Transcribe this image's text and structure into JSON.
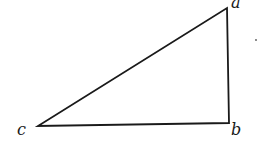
{
  "diagram": {
    "type": "right-triangle",
    "stroke_color": "#1a1a1a",
    "vertices": [
      {
        "id": "a",
        "label": "a",
        "x": 227,
        "y": 8
      },
      {
        "id": "b",
        "label": "b",
        "x": 229,
        "y": 123
      },
      {
        "id": "c",
        "label": "c",
        "x": 38,
        "y": 126
      }
    ],
    "edges": [
      [
        "a",
        "b"
      ],
      [
        "b",
        "c"
      ],
      [
        "c",
        "a"
      ]
    ]
  }
}
